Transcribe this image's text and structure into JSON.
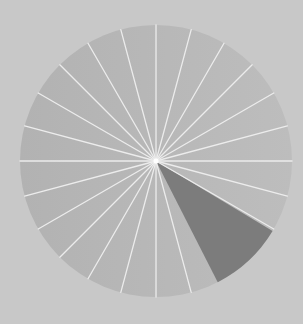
{
  "diagram": {
    "type": "radial-sectors",
    "background_color": "#c8c8c8",
    "circle": {
      "cx": 156,
      "cy": 161,
      "r": 136,
      "fill_left": "#b2b2b2",
      "fill_right": "#bdbdbd"
    },
    "spokes": {
      "count": 24,
      "color": "#ececec",
      "width": 1.3,
      "start_angle_deg": 0
    },
    "highlight_wedge": {
      "start_angle_deg": 31,
      "end_angle_deg": 63,
      "fill": "#7c7c7c"
    },
    "center_dot": {
      "r": 2.5,
      "color": "#ffffff"
    }
  }
}
